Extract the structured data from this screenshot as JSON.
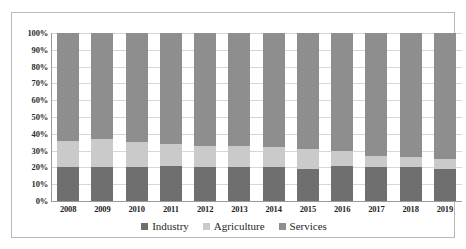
{
  "chart_data": {
    "type": "bar",
    "subtype": "stacked-100-percent",
    "title": "",
    "subtitle": "",
    "xlabel": "",
    "ylabel": "",
    "ylim": [
      0,
      100
    ],
    "ytick_labels": [
      "100%",
      "90%",
      "80%",
      "70%",
      "60%",
      "50%",
      "40%",
      "30%",
      "20%",
      "10%",
      "0%"
    ],
    "ytick_values": [
      100,
      90,
      80,
      70,
      60,
      50,
      40,
      30,
      20,
      10,
      0
    ],
    "grid": true,
    "legend_position": "bottom",
    "categories": [
      "2008",
      "2009",
      "2010",
      "2011",
      "2012",
      "2013",
      "2014",
      "2015",
      "2016",
      "2017",
      "2018",
      "2019"
    ],
    "series": [
      {
        "name": "Industry",
        "color": "#6f6f6f",
        "values": [
          20,
          20,
          20,
          21,
          20,
          20,
          20,
          19,
          21,
          20,
          20,
          19
        ]
      },
      {
        "name": "Agriculture",
        "color": "#cacaca",
        "values": [
          16,
          17,
          15,
          13,
          13,
          13,
          12,
          12,
          9,
          7,
          6,
          6
        ]
      },
      {
        "name": "Services",
        "color": "#8e8e8e",
        "values": [
          64,
          63,
          65,
          66,
          67,
          67,
          68,
          69,
          70,
          73,
          74,
          75
        ]
      }
    ]
  },
  "legend": {
    "items": [
      {
        "label": "Industry",
        "color": "#6f6f6f"
      },
      {
        "label": "Agriculture",
        "color": "#cacaca"
      },
      {
        "label": "Services",
        "color": "#8e8e8e"
      }
    ]
  }
}
